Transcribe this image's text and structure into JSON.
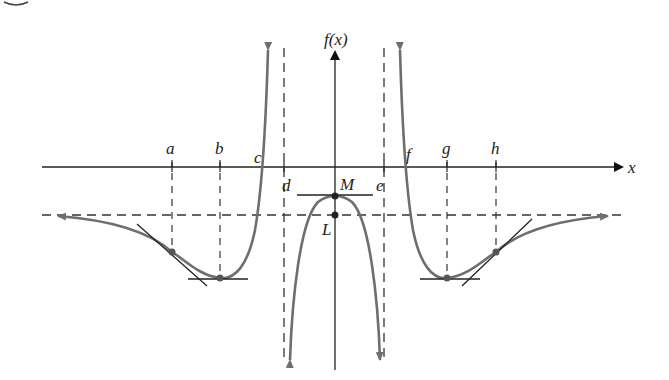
{
  "figure": {
    "type": "function-graph",
    "axes": {
      "x_label": "x",
      "y_label": "f(x)"
    },
    "x_markers": [
      {
        "id": "a",
        "label": "a"
      },
      {
        "id": "b",
        "label": "b"
      },
      {
        "id": "c",
        "label": "c"
      },
      {
        "id": "d",
        "label": "d"
      },
      {
        "id": "e",
        "label": "e"
      },
      {
        "id": "f",
        "label": "f"
      },
      {
        "id": "g",
        "label": "g"
      },
      {
        "id": "h",
        "label": "h"
      }
    ],
    "points": [
      {
        "id": "M",
        "label": "M",
        "description": "local maximum on y-axis"
      },
      {
        "id": "L",
        "label": "L",
        "description": "horizontal asymptote y-intercept"
      }
    ],
    "features": {
      "vertical_asymptotes": [
        "d",
        "e"
      ],
      "horizontal_asymptote": "L",
      "local_minima": [
        "b",
        "g"
      ],
      "local_maximum": "M",
      "inflection_points": [
        "a",
        "h"
      ],
      "x_intercepts": [
        "c",
        "f"
      ]
    },
    "colors": {
      "curve": "#6e6e6e",
      "axes": "#222222",
      "dashed": "#333333",
      "tangent": "#222222"
    }
  }
}
